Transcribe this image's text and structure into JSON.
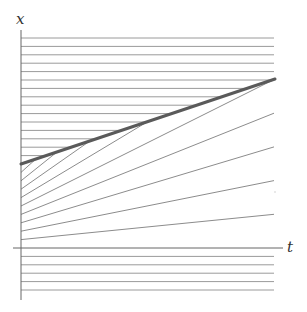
{
  "diagram": {
    "type": "characteristics-diagram",
    "axes": {
      "horizontal_label": "t",
      "vertical_label": "x"
    },
    "colors": {
      "axis": "#666666",
      "horizontal_lines": "#9a9a9a",
      "fan_lines": "#8c8c8c",
      "shock": "#5a5a5a"
    },
    "geometry": {
      "origin": [
        21,
        248
      ],
      "spacing": 8.4,
      "right_edge": 274,
      "shock": {
        "from": [
          21,
          164
        ],
        "to": [
          275,
          79
        ]
      },
      "horizontal_lines_above_shock": 15,
      "horizontal_lines_below_axis": 5,
      "fan_lines": 9,
      "fan_slope_step": 0.1
    }
  }
}
